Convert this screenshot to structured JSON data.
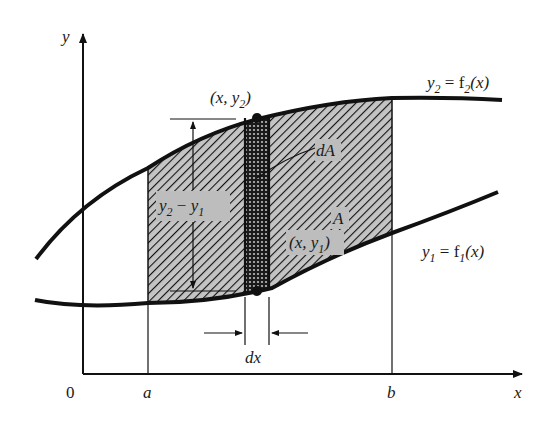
{
  "figure": {
    "type": "area-between-curves",
    "colors": {
      "ink": "#111111",
      "hatch_fill": "#c4c4c4",
      "label_box": "#bdbdbd",
      "background": "#ffffff"
    }
  },
  "axes": {
    "x_label": "x",
    "y_label": "y",
    "origin_label": "0",
    "a_label": "a",
    "b_label": "b"
  },
  "curves": {
    "upper": {
      "name": "y2",
      "label_main": "y",
      "label_sub": "2",
      "label_eq": " = f",
      "label_fsub": "2",
      "label_arg": "(x)"
    },
    "lower": {
      "name": "y1",
      "label_main": "y",
      "label_sub": "1",
      "label_eq": " = f",
      "label_fsub": "1",
      "label_arg": "(x)"
    }
  },
  "annotations": {
    "point_top": {
      "open": "(x, y",
      "sub": "2",
      "close": ")"
    },
    "point_bottom": {
      "open": "(x, y",
      "sub": "1",
      "close": ")"
    },
    "height": {
      "a": "y",
      "a_sub": "2",
      "minus": " − ",
      "b": "y",
      "b_sub": "1"
    },
    "strip_area": "dA",
    "region_area": "A",
    "strip_width": "dx"
  }
}
